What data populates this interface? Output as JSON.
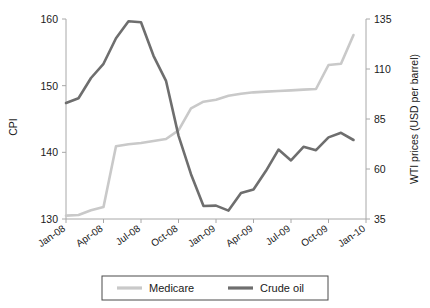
{
  "chart_data": {
    "type": "line",
    "title": "",
    "xlabel": "",
    "ylabel": "CPI",
    "y2label": "WTI prices (USD per barrel)",
    "grid": false,
    "legend_position": "bottom",
    "x": [
      "Jan-08",
      "Feb-08",
      "Mar-08",
      "Apr-08",
      "May-08",
      "Jun-08",
      "Jul-08",
      "Aug-08",
      "Sep-08",
      "Oct-08",
      "Nov-08",
      "Dec-08",
      "Jan-09",
      "Feb-09",
      "Mar-09",
      "Apr-09",
      "May-09",
      "Jun-09",
      "Jul-09",
      "Aug-09",
      "Sep-09",
      "Oct-09",
      "Nov-09",
      "Dec-09"
    ],
    "xticks": [
      "Jan-08",
      "Apr-08",
      "Jul-08",
      "Oct-08",
      "Jan-09",
      "Apr-09",
      "Jul-09",
      "Oct-09",
      "Jan-10"
    ],
    "xtick_indices": [
      0,
      3,
      6,
      9,
      12,
      15,
      18,
      21,
      24
    ],
    "ylim": [
      130,
      160
    ],
    "yticks": [
      130,
      140,
      150,
      160
    ],
    "y2lim": [
      35,
      135
    ],
    "y2ticks": [
      35,
      60,
      85,
      110,
      135
    ],
    "series": [
      {
        "name": "Medicare",
        "axis": "left",
        "color": "#c9c9c9",
        "unit": "CPI",
        "values": [
          130.5,
          130.6,
          131.3,
          131.8,
          140.9,
          141.2,
          141.4,
          141.7,
          142.0,
          143.3,
          146.6,
          147.6,
          147.9,
          148.5,
          148.8,
          149.0,
          149.1,
          149.2,
          149.3,
          149.4,
          149.5,
          153.1,
          153.3,
          157.6
        ]
      },
      {
        "name": "Crude oil",
        "axis": "right",
        "color": "#6e6e6e",
        "unit": "USD per barrel",
        "values": [
          93.0,
          95.4,
          105.5,
          112.6,
          125.4,
          133.9,
          133.4,
          116.6,
          104.1,
          76.7,
          57.4,
          41.5,
          41.7,
          39.2,
          48.0,
          49.8,
          59.1,
          69.7,
          64.3,
          71.1,
          69.4,
          75.8,
          78.1,
          74.5
        ]
      }
    ],
    "legend": [
      {
        "label": "Medicare",
        "color": "#c9c9c9"
      },
      {
        "label": "Crude oil",
        "color": "#6e6e6e"
      }
    ]
  }
}
